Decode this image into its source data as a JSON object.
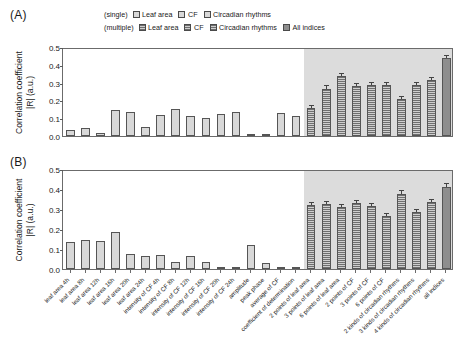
{
  "legend": {
    "rows": [
      {
        "group_label": "(single)",
        "entries": [
          {
            "label": "Leaf area",
            "fill": "dots"
          },
          {
            "label": "CF",
            "fill": "dots"
          },
          {
            "label": "Circadian rhythms",
            "fill": "dots"
          }
        ]
      },
      {
        "group_label": "(multiple)",
        "entries": [
          {
            "label": "Leaf area",
            "fill": "hlines"
          },
          {
            "label": "CF",
            "fill": "hlines"
          },
          {
            "label": "Circadian rhythms",
            "fill": "hlines"
          },
          {
            "label": "All indices",
            "fill": "solid"
          }
        ]
      }
    ]
  },
  "panels": [
    {
      "tag": "(A)"
    },
    {
      "tag": "(B)"
    }
  ],
  "axis": {
    "ylabel_line1": "Correlation coefficient",
    "ylabel_line2": "|R| (a.u.)",
    "yticks": [
      "0.0",
      "0.1",
      "0.2",
      "0.3",
      "0.4",
      "0.5"
    ]
  },
  "chart_data": {
    "type": "bar",
    "title": "",
    "xlabel": "",
    "ylabel": "Correlation coefficient |R| (a.u.)",
    "ylim": [
      0,
      0.5
    ],
    "ytick_values": [
      0.0,
      0.1,
      0.2,
      0.3,
      0.4,
      0.5
    ],
    "grid": false,
    "legend_position": "top",
    "shaded_region_note": "grey background marks multiple-index combinations",
    "categories": [
      "leaf area 4h",
      "leaf area 8h",
      "leaf area 12h",
      "leaf area 16h",
      "leaf area 20h",
      "leaf area 24h",
      "intensity of CF 4h",
      "intensity of CF 8h",
      "intensity of CF 12h",
      "intensity of CF 16h",
      "intensity of CF 20h",
      "intensity of CF 24h",
      "amplitude",
      "peak phase",
      "average of CF",
      "coefficient of determination",
      "2 points of leaf area",
      "3 points of leaf area",
      "6 points of leaf area",
      "2 points of CF",
      "3 points of CF",
      "6 points of CF",
      "2 kinds of circadian rhythms",
      "3 kinds of circadian rhythms",
      "4 kinds of circadian rhythms",
      "all indices"
    ],
    "category_groups": [
      "leaf-area",
      "leaf-area",
      "leaf-area",
      "leaf-area",
      "leaf-area",
      "leaf-area",
      "cf",
      "cf",
      "cf",
      "cf",
      "cf",
      "cf",
      "circadian",
      "circadian",
      "circadian",
      "circadian",
      "leaf-area-multi",
      "leaf-area-multi",
      "leaf-area-multi",
      "cf-multi",
      "cf-multi",
      "cf-multi",
      "circadian-multi",
      "circadian-multi",
      "circadian-multi",
      "all"
    ],
    "multiple_start_index": 16,
    "series": [
      {
        "name": "(A)",
        "panel": "A",
        "values": [
          0.035,
          0.048,
          0.015,
          0.148,
          0.137,
          0.052,
          0.122,
          0.155,
          0.113,
          0.104,
          0.124,
          0.136,
          0.006,
          0.011,
          0.131,
          0.115,
          0.16,
          0.272,
          0.345,
          0.29,
          0.292,
          0.292,
          0.215,
          0.293,
          0.322,
          0.45
        ],
        "errors": [
          0,
          0,
          0,
          0,
          0,
          0,
          0,
          0,
          0,
          0,
          0,
          0,
          0,
          0,
          0,
          0,
          0.012,
          0.014,
          0.013,
          0.012,
          0.011,
          0.012,
          0.011,
          0.012,
          0.013,
          0.012
        ]
      },
      {
        "name": "(B)",
        "panel": "B",
        "values": [
          0.137,
          0.148,
          0.141,
          0.188,
          0.077,
          0.068,
          0.07,
          0.037,
          0.065,
          0.036,
          0.01,
          0.012,
          0.12,
          0.03,
          0.008,
          0.004,
          0.325,
          0.33,
          0.315,
          0.335,
          0.32,
          0.27,
          0.385,
          0.29,
          0.34,
          0.42
        ],
        "errors": [
          0,
          0,
          0,
          0,
          0,
          0,
          0,
          0,
          0,
          0,
          0,
          0,
          0,
          0,
          0,
          0,
          0.012,
          0.012,
          0.014,
          0.012,
          0.013,
          0.012,
          0.013,
          0.012,
          0.013,
          0.013
        ]
      }
    ]
  }
}
